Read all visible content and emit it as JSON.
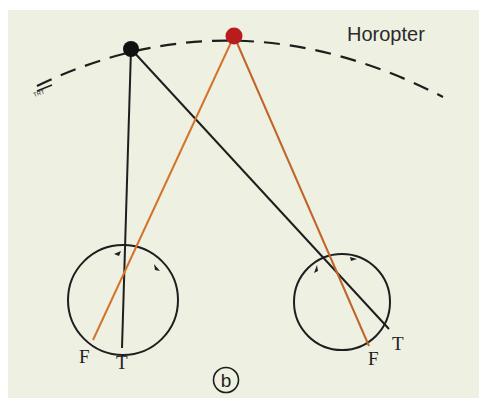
{
  "figure": {
    "panel_label": "b",
    "horopter_label": "Horopter",
    "small_arc_mark": "TRT",
    "colors": {
      "background": "#eef0e2",
      "ink": "#1e1e1e",
      "fixation_dot": "#b81c1c",
      "target_dot": "#111111",
      "red_line": "#d2742a"
    },
    "left_eye": {
      "fovea_label": "F",
      "target_label": "T"
    },
    "right_eye": {
      "fovea_label": "F",
      "target_label": "T"
    }
  }
}
